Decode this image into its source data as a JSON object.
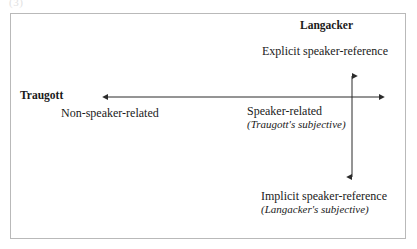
{
  "figure": {
    "caption_fragment": "(3)",
    "border_color": "#b9b9b9",
    "axis_color": "#2b2b2b",
    "background": "#ffffff"
  },
  "labels": {
    "langacker_name": "Langacker",
    "explicit_speaker_reference": "Explicit speaker-reference",
    "traugott_name": "Traugott",
    "non_speaker_related": "Non-speaker-related",
    "speaker_related": "Speaker-related",
    "traugott_subjective": "(Traugott's subjective)",
    "implicit_speaker_reference": "Implicit speaker-reference",
    "langacker_subjective": "(Langacker's subjective)"
  },
  "axes": {
    "horizontal": {
      "name": "Traugott axis",
      "left_end_label": "Non-speaker-related",
      "right_end_label": "Speaker-related",
      "double_headed": true,
      "y": 97,
      "x_start": 100,
      "x_end": 387
    },
    "vertical": {
      "name": "Langacker axis",
      "top_end_label": "Explicit speaker-reference",
      "bottom_end_label": "Implicit speaker-reference",
      "double_headed": true,
      "x": 352,
      "y_start": 68,
      "y_end": 185
    }
  }
}
